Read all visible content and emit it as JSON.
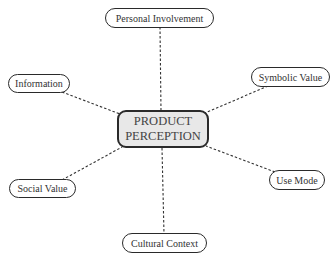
{
  "diagram": {
    "type": "mind-map",
    "center": {
      "line1": "PRODUCT",
      "line2": "PERCEPTION",
      "fill": "#e8e8e8"
    },
    "nodes": [
      {
        "id": "personal-involvement",
        "label": "Personal Involvement"
      },
      {
        "id": "information",
        "label": "Information"
      },
      {
        "id": "symbolic-value",
        "label": "Symbolic Value"
      },
      {
        "id": "social-value",
        "label": "Social Value"
      },
      {
        "id": "use-mode",
        "label": "Use Mode"
      },
      {
        "id": "cultural-context",
        "label": "Cultural Context"
      }
    ],
    "edges": [
      {
        "from": "center",
        "to": "personal-involvement",
        "style": "dashed"
      },
      {
        "from": "center",
        "to": "information",
        "style": "dashed"
      },
      {
        "from": "center",
        "to": "symbolic-value",
        "style": "dashed"
      },
      {
        "from": "center",
        "to": "social-value",
        "style": "dashed"
      },
      {
        "from": "center",
        "to": "use-mode",
        "style": "dashed"
      },
      {
        "from": "center",
        "to": "cultural-context",
        "style": "dashed"
      }
    ]
  }
}
